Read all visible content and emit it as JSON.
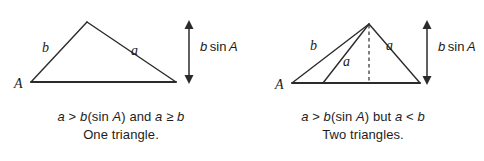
{
  "figure": {
    "background_color": "#ffffff",
    "line_color": "#2b2b2b",
    "text_color": "#1a1a1a"
  },
  "panels": [
    {
      "id": "one-triangle",
      "labels": {
        "vertex_a": "A",
        "side_b": "b",
        "side_a": "a",
        "height_var": "b",
        "height_fn": "sin",
        "height_angle": "A",
        "height_full": "b sin A"
      },
      "caption": {
        "line1_parts": [
          {
            "text": "a",
            "style": "italic"
          },
          {
            "text": " > ",
            "style": "roman"
          },
          {
            "text": "b",
            "style": "italic"
          },
          {
            "text": "(",
            "style": "roman"
          },
          {
            "text": "sin ",
            "style": "roman"
          },
          {
            "text": "A",
            "style": "italic"
          },
          {
            "text": ") and ",
            "style": "roman"
          },
          {
            "text": "a",
            "style": "italic"
          },
          {
            "text": " ≥ ",
            "style": "roman"
          },
          {
            "text": "b",
            "style": "italic"
          }
        ],
        "line1_plain": "a > b(sin A) and a ≥ b",
        "line2": "One triangle."
      }
    },
    {
      "id": "two-triangles",
      "labels": {
        "vertex_a": "A",
        "side_b": "b",
        "side_a_right": "a",
        "side_a_inner": "a",
        "height_var": "b",
        "height_fn": "sin",
        "height_angle": "A",
        "height_full": "b sin A"
      },
      "caption": {
        "line1_parts": [
          {
            "text": "a",
            "style": "italic"
          },
          {
            "text": " > ",
            "style": "roman"
          },
          {
            "text": "b",
            "style": "italic"
          },
          {
            "text": "(",
            "style": "roman"
          },
          {
            "text": "sin ",
            "style": "roman"
          },
          {
            "text": "A",
            "style": "italic"
          },
          {
            "text": ") but ",
            "style": "roman"
          },
          {
            "text": "a",
            "style": "italic"
          },
          {
            "text": " < ",
            "style": "roman"
          },
          {
            "text": "b",
            "style": "italic"
          }
        ],
        "line1_plain": "a > b(sin A) but a < b",
        "line2": "Two triangles."
      }
    }
  ]
}
